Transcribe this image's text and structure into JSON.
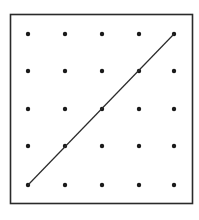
{
  "diagram": {
    "type": "dot-grid-geoboard",
    "rows": 5,
    "cols": 5,
    "colors": {
      "frame": "#2a2a2a",
      "dot": "#1a1a1a",
      "line": "#2a2a2a",
      "background": "#ffffff"
    },
    "frame": {
      "x": 10.5,
      "y": 14.5,
      "width": 182,
      "height": 189
    },
    "grid_x": [
      28,
      65,
      102,
      139,
      174
    ],
    "grid_y": [
      34,
      71,
      109,
      146,
      185
    ],
    "dot_radius": 2.2,
    "segment": {
      "from": {
        "col": 0,
        "row": 4
      },
      "to": {
        "col": 4,
        "row": 0
      },
      "passes_through": [
        [
          0,
          4
        ],
        [
          1,
          3
        ],
        [
          2,
          2
        ],
        [
          3,
          1
        ],
        [
          4,
          0
        ]
      ]
    }
  }
}
